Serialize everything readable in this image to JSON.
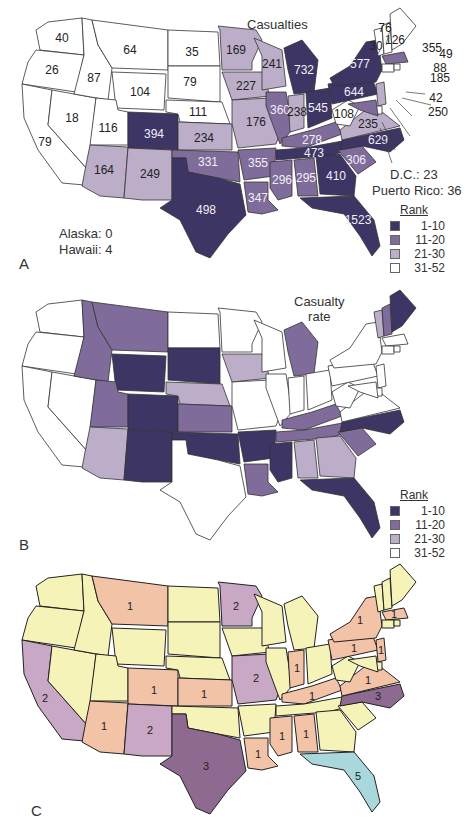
{
  "chart_data": [
    {
      "type": "choropleth",
      "panel": "A",
      "title": "Casualties",
      "legend": {
        "title": "Rank",
        "bins": [
          {
            "label": "1-10",
            "color": "#3d3563"
          },
          {
            "label": "11-20",
            "color": "#7f6c9b"
          },
          {
            "label": "21-30",
            "color": "#bcaec9"
          },
          {
            "label": "31-52",
            "color": "#ffffff"
          }
        ]
      },
      "notes": [
        "Alaska: 0",
        "Hawaii: 4",
        "D.C.: 23",
        "Puerto Rico: 36"
      ],
      "values": {
        "WA": 40,
        "OR": 26,
        "CA": 79,
        "ID": 87,
        "NV": 18,
        "MT": 64,
        "WY": 104,
        "UT": 116,
        "AZ": 164,
        "CO": 394,
        "NM": 249,
        "ND": 35,
        "SD": 79,
        "NE": 111,
        "KS": 234,
        "OK": 331,
        "TX": 498,
        "MN": 169,
        "IA": 227,
        "MO": 176,
        "AR": 355,
        "LA": 347,
        "WI": 241,
        "IL": 360,
        "MI": 732,
        "IN": 238,
        "OH": 545,
        "KY": 278,
        "TN": 473,
        "MS": 296,
        "AL": 295,
        "GA": 410,
        "FL": 1523,
        "SC": 306,
        "NC": 629,
        "VA": 235,
        "WV": 108,
        "PA": 644,
        "NY": 577,
        "VT": 30,
        "NH": 76,
        "ME": 126,
        "MA": 355,
        "RI": 49,
        "CT": 88,
        "NJ": 185,
        "DE": 42,
        "MD": 250
      }
    },
    {
      "type": "choropleth",
      "panel": "B",
      "title": "Casualty rate",
      "legend": {
        "title": "Rank",
        "bins": [
          {
            "label": "1-10",
            "color": "#3d3563"
          },
          {
            "label": "11-20",
            "color": "#7f6c9b"
          },
          {
            "label": "21-30",
            "color": "#bcaec9"
          },
          {
            "label": "31-52",
            "color": "#ffffff"
          }
        ]
      },
      "rank_bins": {
        "1-10": [
          "WY",
          "SD",
          "CO",
          "NM",
          "OK",
          "AR",
          "MS",
          "NC",
          "FL",
          "ME"
        ],
        "11-20": [
          "ID",
          "MT",
          "UT",
          "KS",
          "LA",
          "MI",
          "KY",
          "TN",
          "SC",
          "NH"
        ],
        "21-30": [
          "AZ",
          "NE",
          "IA",
          "AL",
          "GA",
          "VT"
        ],
        "31-52": [
          "WA",
          "OR",
          "CA",
          "NV",
          "ND",
          "MN",
          "WI",
          "IL",
          "IN",
          "OH",
          "MO",
          "TX",
          "WV",
          "VA",
          "PA",
          "NY",
          "MA",
          "CT",
          "RI",
          "NJ",
          "DE",
          "MD"
        ]
      }
    },
    {
      "type": "choropleth",
      "panel": "C",
      "title": "",
      "values": {
        "MT": 1,
        "CO": 1,
        "KS": 1,
        "AZ": 1,
        "CA": 2,
        "NM": 2,
        "TX": 3,
        "MN": 2,
        "MO": 2,
        "IN": 1,
        "KY": 1,
        "PA": 1,
        "NY": 1,
        "VA": 1,
        "NC": 3,
        "MS": 1,
        "AL": 1,
        "LA": 1,
        "FL": 5,
        "MA": 1,
        "NJ": 1
      },
      "colors": {
        "0": "#f6f3b8",
        "1": "#f2c3a7",
        "2": "#c9a8c6",
        "3": "#8e6a90",
        "5": "#a8d8dc"
      }
    }
  ],
  "panelA": {
    "letter": "A",
    "title": "Casualties",
    "note_alaska": "Alaska: 0",
    "note_hawaii": "Hawaii: 4",
    "note_dc": "D.C.: 23",
    "note_pr": "Puerto Rico: 36",
    "legend_title": "Rank",
    "legend": [
      "1-10",
      "11-20",
      "21-30",
      "31-52"
    ]
  },
  "panelB": {
    "letter": "B",
    "title_line1": "Casualty",
    "title_line2": "rate",
    "legend_title": "Rank",
    "legend": [
      "1-10",
      "11-20",
      "21-30",
      "31-52"
    ]
  },
  "panelC": {
    "letter": "C"
  },
  "colors": {
    "rank1": "#3d3563",
    "rank2": "#7f6c9b",
    "rank3": "#bcaec9",
    "rank4": "#ffffff",
    "c0": "#f6f3b8",
    "c1": "#f2c3a7",
    "c2": "#c9a8c6",
    "c3": "#8e6a90",
    "c5": "#a8d8dc"
  }
}
